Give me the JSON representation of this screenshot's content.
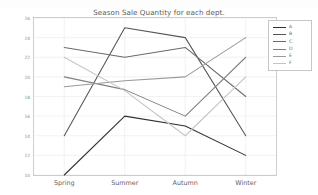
{
  "figure": {
    "title": "Season Sale Quantity for each dept.",
    "background": "#ffffff"
  },
  "chart_data": {
    "type": "line",
    "title": "Season Sale Quantity for each dept.",
    "xlabel": "",
    "ylabel": "",
    "categories": [
      "Spring",
      "Summer",
      "Autumn",
      "Winter"
    ],
    "yticks": [
      10,
      12,
      14,
      16,
      18,
      20,
      22,
      24,
      26
    ],
    "ylim": [
      10,
      26
    ],
    "grid": true,
    "legend_position": "upper right",
    "series": [
      {
        "name": "A",
        "color": "#2f2f2f",
        "values": [
          10,
          16,
          15,
          12
        ]
      },
      {
        "name": "B",
        "color": "#555555",
        "values": [
          14,
          25,
          24,
          14
        ]
      },
      {
        "name": "C",
        "color": "#6a6a6a",
        "values": [
          23,
          22,
          23,
          18
        ]
      },
      {
        "name": "D",
        "color": "#808080",
        "values": [
          20,
          18.7,
          16,
          22
        ]
      },
      {
        "name": "E",
        "color": "#9a9a9a",
        "values": [
          19,
          19.6,
          20,
          24
        ]
      },
      {
        "name": "F",
        "color": "#c4c4c4",
        "values": [
          22,
          18.6,
          14,
          20
        ]
      }
    ]
  },
  "axes": {
    "ytick_labels": [
      "26",
      "24",
      "22",
      "20",
      "18",
      "16",
      "14",
      "12",
      "10"
    ],
    "xtick_labels": [
      "Spring",
      "Summer",
      "Autumn",
      "Winter"
    ]
  },
  "legend": {
    "entries": [
      {
        "label": "A",
        "color": "#2f2f2f"
      },
      {
        "label": "B",
        "color": "#555555"
      },
      {
        "label": "C",
        "color": "#6a6a6a"
      },
      {
        "label": "D",
        "color": "#808080"
      },
      {
        "label": "E",
        "color": "#9a9a9a"
      },
      {
        "label": "F",
        "color": "#c4c4c4"
      }
    ]
  }
}
